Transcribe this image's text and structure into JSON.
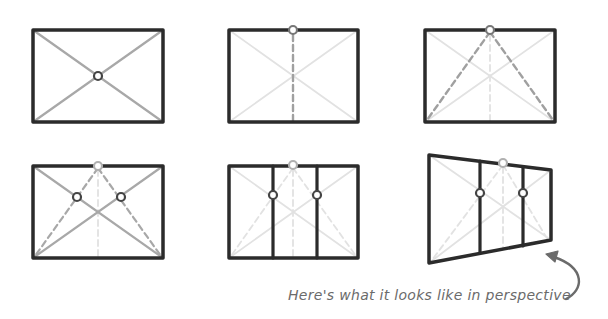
{
  "caption": "Here's what it looks like in perspective",
  "colors": {
    "frame": "#2b2b2b",
    "diagonal": "#a8a8a8",
    "faint": "#e0e0e0",
    "dashed": "#a0a0a0",
    "point_dark": "#444444",
    "point_light": "#b0b0b0",
    "arrow": "#6b6b6b"
  },
  "panels": [
    {
      "id": 1,
      "label": "rectangle with diagonals and center point"
    },
    {
      "id": 2,
      "label": "vertical dashed line from center up to top midpoint"
    },
    {
      "id": 3,
      "label": "dashed lines from top midpoint to bottom corners"
    },
    {
      "id": 4,
      "label": "intersections of diagonals with dashed lines"
    },
    {
      "id": 5,
      "label": "vertical dividers through intersection points"
    },
    {
      "id": 6,
      "label": "same construction in perspective"
    }
  ]
}
